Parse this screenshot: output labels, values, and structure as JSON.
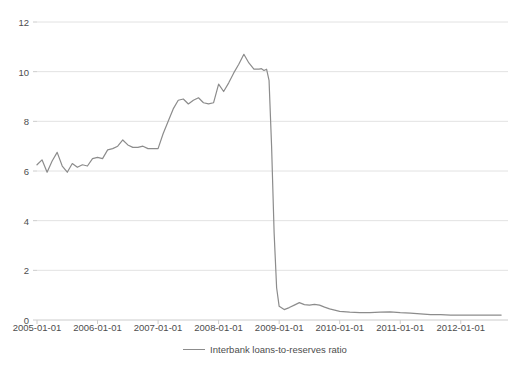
{
  "chart_data": {
    "type": "line",
    "title": "",
    "xlabel": "",
    "ylabel": "",
    "grid": true,
    "legend_position": "bottom-center",
    "xlim": [
      "2005-01-01",
      "2012-09-01"
    ],
    "ylim": [
      0,
      12
    ],
    "y_ticks": [
      "0",
      "2",
      "4",
      "6",
      "8",
      "10",
      "12"
    ],
    "y_tick_values": [
      0,
      2,
      4,
      6,
      8,
      10,
      12
    ],
    "x_ticks": [
      "2005-01-01",
      "2006-01-01",
      "2007-01-01",
      "2008-01-01",
      "2009-01-01",
      "2010-01-01",
      "2011-01-01",
      "2012-01-01"
    ],
    "x_tick_values": [
      2005.0,
      2006.0,
      2007.0,
      2008.0,
      2009.0,
      2010.0,
      2011.0,
      2012.0
    ],
    "series": [
      {
        "name": "Interbank loans-to-reserves ratio",
        "color": "#8c8c8c",
        "x": [
          2005.0,
          2005.083,
          2005.167,
          2005.25,
          2005.333,
          2005.417,
          2005.5,
          2005.583,
          2005.667,
          2005.75,
          2005.833,
          2005.917,
          2006.0,
          2006.083,
          2006.167,
          2006.25,
          2006.333,
          2006.417,
          2006.5,
          2006.583,
          2006.667,
          2006.75,
          2006.833,
          2006.917,
          2007.0,
          2007.083,
          2007.167,
          2007.25,
          2007.333,
          2007.417,
          2007.5,
          2007.583,
          2007.667,
          2007.75,
          2007.833,
          2007.917,
          2008.0,
          2008.083,
          2008.167,
          2008.25,
          2008.333,
          2008.417,
          2008.5,
          2008.583,
          2008.667,
          2008.708,
          2008.75,
          2008.792,
          2008.833,
          2008.875,
          2008.917,
          2008.958,
          2009.0,
          2009.083,
          2009.167,
          2009.25,
          2009.333,
          2009.417,
          2009.5,
          2009.583,
          2009.667,
          2009.75,
          2009.833,
          2009.917,
          2010.0,
          2010.167,
          2010.333,
          2010.5,
          2010.667,
          2010.833,
          2011.0,
          2011.167,
          2011.333,
          2011.5,
          2011.667,
          2011.833,
          2012.0,
          2012.167,
          2012.333,
          2012.5,
          2012.667
        ],
        "y": [
          6.25,
          6.45,
          5.95,
          6.4,
          6.75,
          6.2,
          5.95,
          6.3,
          6.15,
          6.25,
          6.2,
          6.5,
          6.55,
          6.5,
          6.85,
          6.9,
          7.0,
          7.25,
          7.05,
          6.95,
          6.95,
          7.0,
          6.9,
          6.9,
          6.9,
          7.5,
          8.0,
          8.5,
          8.85,
          8.9,
          8.7,
          8.85,
          8.95,
          8.75,
          8.7,
          8.75,
          9.5,
          9.2,
          9.55,
          9.95,
          10.3,
          10.7,
          10.35,
          10.1,
          10.1,
          10.12,
          10.05,
          10.1,
          9.65,
          7.0,
          3.5,
          1.3,
          0.55,
          0.42,
          0.5,
          0.6,
          0.7,
          0.62,
          0.6,
          0.63,
          0.6,
          0.52,
          0.45,
          0.4,
          0.35,
          0.32,
          0.3,
          0.3,
          0.32,
          0.33,
          0.3,
          0.28,
          0.25,
          0.22,
          0.22,
          0.2,
          0.2,
          0.2,
          0.2,
          0.2,
          0.2
        ]
      }
    ]
  },
  "legend": {
    "entries": [
      {
        "label": "Interbank loans-to-reserves ratio"
      }
    ]
  },
  "axes": {
    "y_labels": [
      "12",
      "10",
      "8",
      "6",
      "4",
      "2",
      "0"
    ],
    "x_labels": [
      "2005-01-01",
      "2006-01-01",
      "2007-01-01",
      "2008-01-01",
      "2009-01-01",
      "2010-01-01",
      "2011-01-01",
      "2012-01-01"
    ]
  },
  "colors": {
    "line": "#8c8c8c",
    "grid": "#e2e2e2",
    "axis": "#cccccc",
    "text": "#4d4d4d",
    "background": "#ffffff"
  }
}
